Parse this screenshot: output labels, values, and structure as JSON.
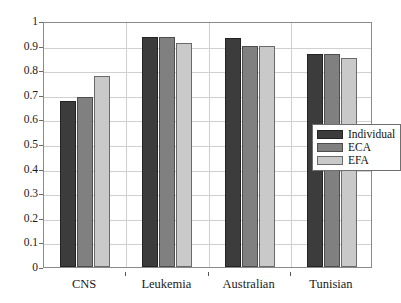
{
  "chart_data": {
    "type": "bar",
    "title": "",
    "subtitle": "",
    "xlabel": "",
    "ylabel": "",
    "categories": [
      "CNS",
      "Leukemia",
      "Australian",
      "Tunisian"
    ],
    "series": [
      {
        "name": "Individual",
        "color": "#3c3c3c",
        "values": [
          0.675,
          0.935,
          0.93,
          0.865
        ]
      },
      {
        "name": "ECA",
        "color": "#808080",
        "values": [
          0.69,
          0.935,
          0.9,
          0.865
        ]
      },
      {
        "name": "EFA",
        "color": "#c9c9c9",
        "values": [
          0.775,
          0.91,
          0.9,
          0.85
        ]
      }
    ],
    "ylim": [
      0,
      1
    ],
    "yticks": [
      0,
      0.1,
      0.2,
      0.3,
      0.4,
      0.5,
      0.6,
      0.7,
      0.8,
      0.9,
      1
    ],
    "ytick_labels": [
      "0",
      "0.1",
      "0.2",
      "0.3",
      "0.4",
      "0.5",
      "0.6",
      "0.7",
      "0.8",
      "0.9",
      "1"
    ],
    "grid": true,
    "grid_axis": "both",
    "legend_position": "center-right",
    "legend_entries": [
      "Individual",
      "ECA",
      "EFA"
    ],
    "background_color": "#ffffff",
    "axis_color": "#8a8a8a",
    "grid_color": "#d0d0d0"
  }
}
